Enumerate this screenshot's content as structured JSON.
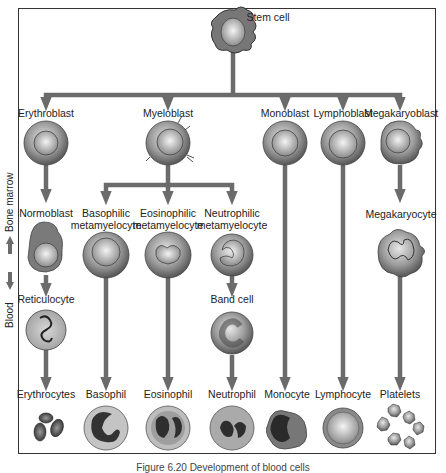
{
  "figure": {
    "caption": "Figure 6.20 Development of blood cells",
    "colors": {
      "arrow": "#6b6b6b",
      "cell_shade": "#8a8a8a",
      "frame": "#333333"
    }
  },
  "stem": {
    "label": "Stem cell"
  },
  "side_labels": {
    "bone_marrow": "Bone marrow",
    "blood": "Blood"
  },
  "row1": [
    {
      "label": "Erythroblast"
    },
    {
      "label": "Myeloblast"
    },
    {
      "label": "Monoblast"
    },
    {
      "label": "Lymphoblast"
    },
    {
      "label": "Megakaryoblast"
    }
  ],
  "row2": [
    {
      "label": "Normoblast"
    },
    {
      "label": "Basophilic\nmetamyelocyte",
      "line1": "Basophilic",
      "line2": "metamyelocyte"
    },
    {
      "label": "Eosinophilic\nmetamyelocyte",
      "line1": "Eosinophilic",
      "line2": "metamyelocyte"
    },
    {
      "label": "Neutrophilic\nmetamyelocyte",
      "line1": "Neutrophilic",
      "line2": "metamyelocyte"
    },
    {
      "label": "Megakaryocyte"
    }
  ],
  "row3": [
    {
      "label": "Reticulocyte"
    },
    {
      "label": "Band cell"
    }
  ],
  "final": [
    {
      "label": "Erythrocytes"
    },
    {
      "label": "Basophil"
    },
    {
      "label": "Eosinophil"
    },
    {
      "label": "Neutrophil"
    },
    {
      "label": "Monocyte"
    },
    {
      "label": "Lymphocyte"
    },
    {
      "label": "Platelets"
    }
  ]
}
